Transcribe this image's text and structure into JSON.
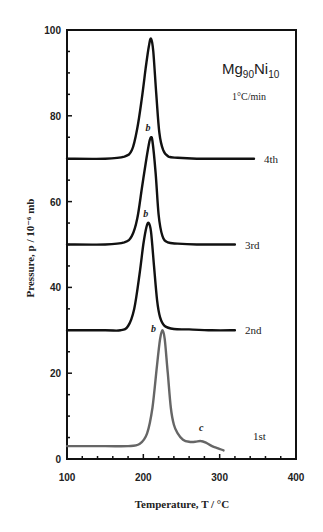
{
  "chart_data": {
    "type": "line",
    "title": "",
    "annotation_composition": {
      "base": "Mg",
      "sub1": "90",
      "mid": "Ni",
      "sub2": "10"
    },
    "annotation_rate": "1°C/min",
    "xlabel": "Temperature, T / °C",
    "ylabel": "Pressure, p / 10⁻⁶ mb",
    "xlim": [
      100,
      400
    ],
    "ylim": [
      0,
      100
    ],
    "x_ticks": [
      100,
      200,
      300,
      400
    ],
    "y_ticks": [
      0,
      20,
      40,
      60,
      80,
      100
    ],
    "grid": false,
    "legend": "inline labels at right end of each curve",
    "series": [
      {
        "name": "1st",
        "color": "#666666",
        "peak_label": "b",
        "shoulder_label": "c",
        "x": [
          100,
          150,
          180,
          195,
          205,
          212,
          218,
          222,
          225,
          228,
          232,
          236,
          240,
          245,
          252,
          260,
          268,
          275,
          282,
          290,
          298,
          305
        ],
        "y": [
          3,
          3,
          3,
          3.5,
          6,
          12,
          22,
          28,
          30,
          28,
          20,
          12,
          8,
          6,
          4.5,
          4,
          4,
          4.2,
          3.8,
          3,
          2.5,
          2
        ]
      },
      {
        "name": "2nd",
        "color": "#111111",
        "peak_label": "b",
        "x": [
          100,
          150,
          170,
          180,
          188,
          195,
          200,
          204,
          207,
          210,
          214,
          218,
          222,
          228,
          240,
          260,
          290,
          320
        ],
        "y": [
          30,
          30,
          30,
          31,
          35,
          43,
          50,
          54,
          55,
          53,
          45,
          37,
          33,
          31,
          30.3,
          30.2,
          30,
          30
        ]
      },
      {
        "name": "3rd",
        "color": "#111111",
        "peak_label": "b",
        "x": [
          100,
          150,
          175,
          185,
          192,
          198,
          204,
          208,
          210,
          212,
          216,
          220,
          225,
          232,
          245,
          270,
          300,
          320
        ],
        "y": [
          50,
          50,
          50.5,
          52,
          56,
          63,
          70,
          74,
          75,
          74,
          67,
          57,
          52,
          50.5,
          50.2,
          50,
          50,
          50
        ]
      },
      {
        "name": "4th",
        "color": "#111111",
        "x": [
          100,
          150,
          175,
          185,
          192,
          198,
          203,
          207,
          210,
          213,
          217,
          221,
          226,
          233,
          245,
          270,
          310,
          345
        ],
        "y": [
          70,
          70,
          70.5,
          72,
          77,
          84,
          91,
          96,
          98,
          95,
          85,
          76,
          72,
          70.5,
          70.2,
          70,
          70,
          70
        ]
      }
    ]
  }
}
